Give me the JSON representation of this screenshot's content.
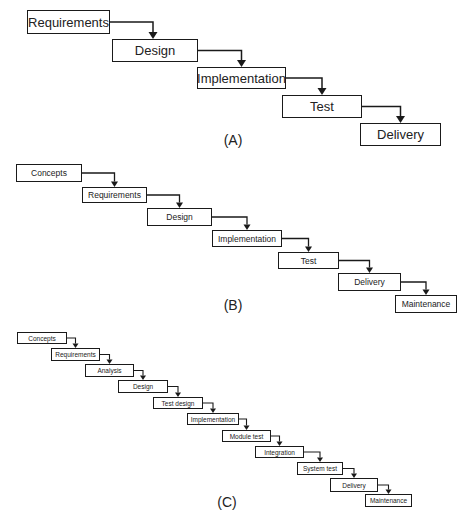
{
  "diagrams": [
    {
      "id": "A",
      "caption": "(A)",
      "caption_pos": [
        233,
        132
      ],
      "size": "a",
      "steps": [
        {
          "label": "Requirements",
          "box": [
            27,
            10,
            83,
            24
          ]
        },
        {
          "label": "Design",
          "box": [
            112,
            39,
            86,
            23
          ]
        },
        {
          "label": "Implementation",
          "box": [
            197,
            67,
            89,
            22
          ]
        },
        {
          "label": "Test",
          "box": [
            282,
            95,
            80,
            23
          ]
        },
        {
          "label": "Delivery",
          "box": [
            360,
            123,
            81,
            23
          ]
        }
      ]
    },
    {
      "id": "B",
      "caption": "(B)",
      "caption_pos": [
        233,
        297
      ],
      "size": "b",
      "steps": [
        {
          "label": "Concepts",
          "box": [
            16,
            164,
            66,
            18
          ]
        },
        {
          "label": "Requirements",
          "box": [
            82,
            187,
            65,
            16
          ]
        },
        {
          "label": "Design",
          "box": [
            147,
            208,
            65,
            18
          ]
        },
        {
          "label": "Implementation",
          "box": [
            212,
            230,
            70,
            17
          ]
        },
        {
          "label": "Test",
          "box": [
            278,
            252,
            61,
            17
          ]
        },
        {
          "label": "Delivery",
          "box": [
            338,
            273,
            63,
            18
          ]
        },
        {
          "label": "Maintenance",
          "box": [
            395,
            295,
            62,
            18
          ]
        }
      ]
    },
    {
      "id": "C",
      "caption": "(C)",
      "caption_pos": [
        227,
        494
      ],
      "size": "c",
      "steps": [
        {
          "label": "Concepts",
          "box": [
            17,
            332,
            50,
            12
          ]
        },
        {
          "label": "Requirements",
          "box": [
            51,
            348,
            49,
            13
          ]
        },
        {
          "label": "Analysis",
          "box": [
            85,
            364,
            49,
            13
          ]
        },
        {
          "label": "Design",
          "box": [
            118,
            380,
            50,
            13
          ]
        },
        {
          "label": "Test design",
          "box": [
            153,
            397,
            50,
            12
          ]
        },
        {
          "label": "Implementation",
          "box": [
            187,
            413,
            52,
            12
          ]
        },
        {
          "label": "Module test",
          "box": [
            222,
            430,
            49,
            12
          ]
        },
        {
          "label": "Integration",
          "box": [
            255,
            446,
            49,
            12
          ]
        },
        {
          "label": "System test",
          "box": [
            297,
            462,
            46,
            13
          ]
        },
        {
          "label": "Delivery",
          "box": [
            330,
            478,
            48,
            14
          ]
        },
        {
          "label": "Maintenance",
          "box": [
            365,
            494,
            47,
            13
          ]
        }
      ]
    }
  ],
  "colors": {
    "line": "#1a1a1a",
    "background": "#ffffff",
    "text": "#222222"
  }
}
